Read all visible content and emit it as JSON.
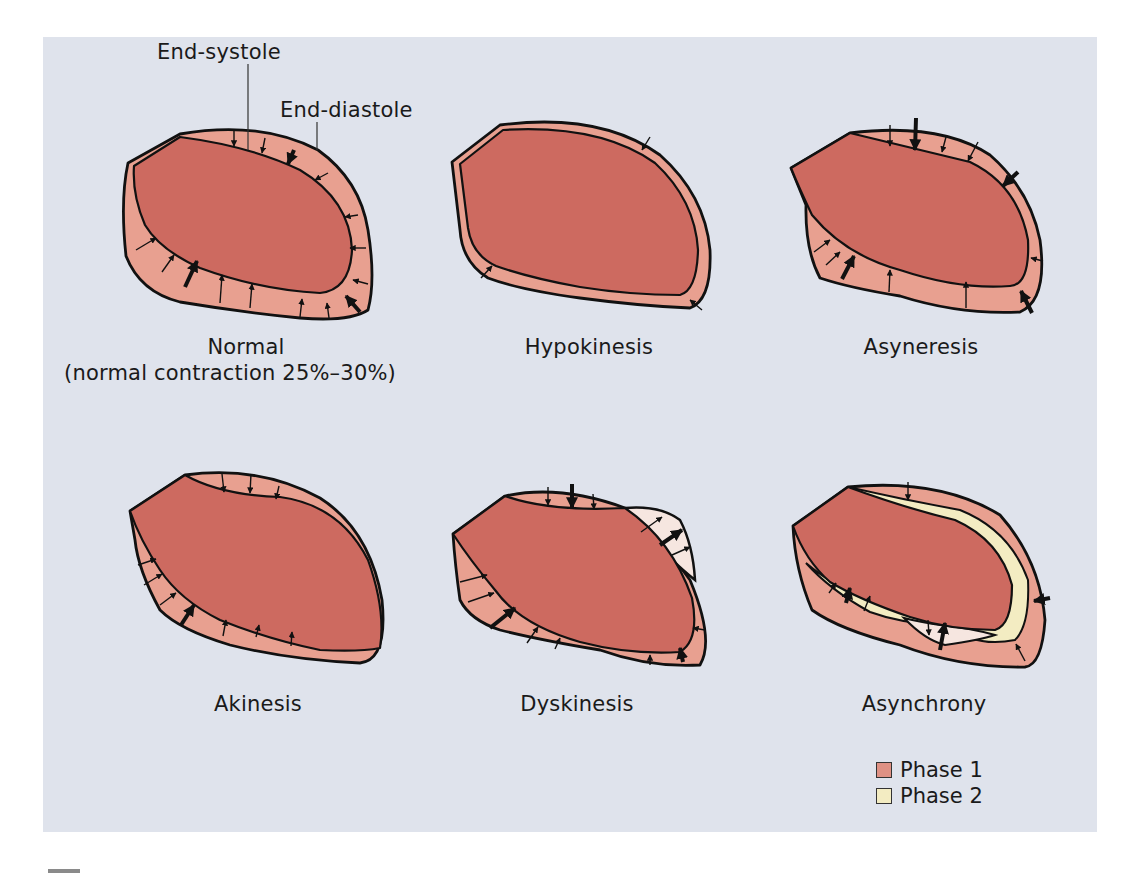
{
  "figure": {
    "annotations": {
      "end_systole": "End-systole",
      "end_diastole": "End-diastole"
    },
    "panels": [
      {
        "id": "normal",
        "title": "Normal",
        "subtitle": "(normal contraction 25%–30%)"
      },
      {
        "id": "hypokinesis",
        "title": "Hypokinesis"
      },
      {
        "id": "asyneresis",
        "title": "Asyneresis"
      },
      {
        "id": "akinesis",
        "title": "Akinesis"
      },
      {
        "id": "dyskinesis",
        "title": "Dyskinesis"
      },
      {
        "id": "asynchrony",
        "title": "Asynchrony"
      }
    ],
    "legend": [
      {
        "label": "Phase 1",
        "color": "#df9184"
      },
      {
        "label": "Phase 2",
        "color": "#f3ecc2"
      }
    ],
    "colors": {
      "background": "#dfe3ec",
      "cavity": "#cd6a60",
      "wall": "#e8a090",
      "phase2": "#f3ecc2",
      "bulge": "#f6e6e0",
      "outline": "#111111"
    }
  }
}
